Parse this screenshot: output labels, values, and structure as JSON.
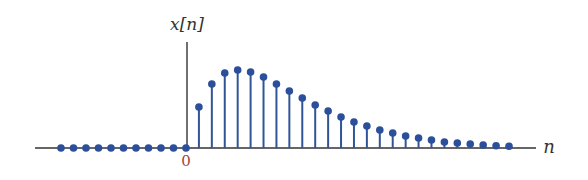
{
  "chart_data": {
    "type": "stem",
    "title": "",
    "ylabel": "x[n]",
    "xlabel": "n",
    "x_tick_labels": [
      {
        "n": 0,
        "label": "0"
      }
    ],
    "grid": false,
    "legend": null,
    "xlim": [
      -12,
      28
    ],
    "x": [
      -10,
      -9,
      -8,
      -7,
      -6,
      -5,
      -4,
      -3,
      -2,
      -1,
      0,
      1,
      2,
      3,
      4,
      5,
      6,
      7,
      8,
      9,
      10,
      11,
      12,
      13,
      14,
      15,
      16,
      17,
      18,
      19,
      20,
      21,
      22,
      23,
      24,
      25
    ],
    "values": [
      0,
      0,
      0,
      0,
      0,
      0,
      0,
      0,
      0,
      0,
      0,
      41,
      64,
      75,
      78,
      76,
      71,
      64,
      57,
      50,
      43,
      37,
      31,
      26,
      22,
      18,
      15,
      12,
      10,
      8,
      6,
      5,
      4,
      3,
      2.3,
      1.7
    ],
    "units": "relative height (peak ≈ 78 at n=4)"
  },
  "labels": {
    "y_axis": "x[n]",
    "x_axis": "n",
    "origin": "0"
  },
  "colors": {
    "stem": "#2f5597",
    "marker": "#2b4f9a",
    "axis": "#333333",
    "origin_label": "#a0443c",
    "text": "#333333"
  }
}
